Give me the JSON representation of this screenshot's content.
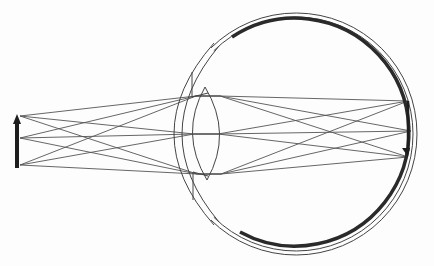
{
  "diagram": {
    "title": "",
    "colors": {
      "background": "#fdfdfd",
      "line": "#444444",
      "ray": "#555555",
      "retina": "#2a2a2a"
    },
    "object_arrow": {
      "x": 17,
      "y_top": 114,
      "y_bottom": 168,
      "points": [
        {
          "name": "top",
          "x": 20,
          "y": 116
        },
        {
          "name": "middle",
          "x": 20,
          "y": 138
        },
        {
          "name": "bottom",
          "x": 20,
          "y": 165
        }
      ]
    },
    "eyeball": {
      "cx": 296,
      "cy": 134,
      "r": 121,
      "inner_r": 117
    },
    "cornea": {
      "left_x_outer": 164,
      "left_x_inner": 171
    },
    "iris": {
      "top": {
        "x": 192,
        "y1": 72,
        "y2": 97
      },
      "bottom": {
        "x": 193,
        "y1": 172,
        "y2": 200
      }
    },
    "lens": {
      "top": {
        "x": 205,
        "y": 87
      },
      "bottom": {
        "x": 207,
        "y": 180
      },
      "left_bulge_x": 193,
      "right_bulge_x": 219
    },
    "lens_ray_points": [
      {
        "x": 196,
        "y": 96
      },
      {
        "x": 194,
        "y": 134
      },
      {
        "x": 197,
        "y": 174
      }
    ],
    "image_points": [
      {
        "name": "image-of-bottom",
        "x": 408,
        "y": 101
      },
      {
        "name": "image-of-middle",
        "x": 411,
        "y": 131
      },
      {
        "name": "image-of-top",
        "x": 408,
        "y": 157
      }
    ],
    "retina_arc": {
      "start": {
        "x": 232,
        "y": 37
      },
      "end": {
        "x": 240,
        "y": 232
      }
    }
  }
}
